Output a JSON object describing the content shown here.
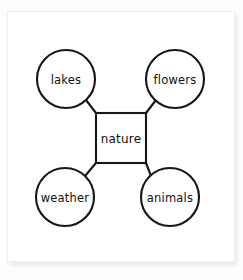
{
  "diagram": {
    "type": "concept-map",
    "title_text": "nature",
    "center": {
      "id": "center",
      "shape": "rectangle",
      "label": "nature",
      "x": 121,
      "y": 138,
      "width": 50,
      "height": 50
    },
    "nodes": [
      {
        "id": "lakes",
        "shape": "circle",
        "label": "lakes",
        "position": "top-left",
        "cx": 66,
        "cy": 79,
        "r": 29
      },
      {
        "id": "flowers",
        "shape": "circle",
        "label": "flowers",
        "position": "top-right",
        "cx": 175,
        "cy": 79,
        "r": 29
      },
      {
        "id": "weather",
        "shape": "circle",
        "label": "weather",
        "position": "bottom-left",
        "cx": 65,
        "cy": 197,
        "r": 29
      },
      {
        "id": "animals",
        "shape": "circle",
        "label": "animals",
        "position": "bottom-right",
        "cx": 170,
        "cy": 197,
        "r": 29
      }
    ],
    "connectors": [
      {
        "id": "center-to-lakes",
        "from": "center",
        "to": "lakes",
        "x1": 96,
        "y1": 113,
        "x2": 86,
        "y2": 100
      },
      {
        "id": "center-to-flowers",
        "from": "center",
        "to": "flowers",
        "x1": 146,
        "y1": 113,
        "x2": 155,
        "y2": 100
      },
      {
        "id": "center-to-weather",
        "from": "center",
        "to": "weather",
        "x1": 96,
        "y1": 163,
        "x2": 85,
        "y2": 176
      },
      {
        "id": "center-to-animals",
        "from": "center",
        "to": "animals",
        "x1": 146,
        "y1": 163,
        "x2": 150,
        "y2": 176
      }
    ],
    "colors": {
      "stroke": "#161616",
      "node_fill": "#ffffff",
      "paper": "#ffffff",
      "page_background": "#fdfdfd",
      "paper_border": "#f0f0f0"
    }
  }
}
